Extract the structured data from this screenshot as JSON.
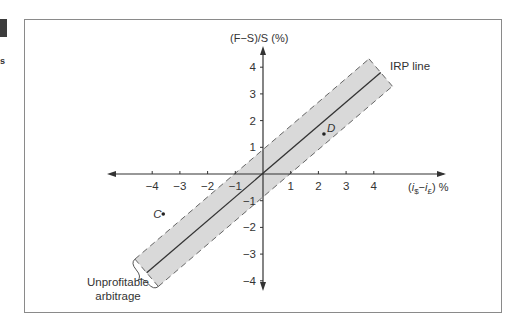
{
  "page": {
    "side_mark": "s"
  },
  "chart_data": {
    "type": "line",
    "title": "",
    "xlabel": "(i$ − i£) %",
    "xlabel_parts": {
      "open": "(",
      "i1": "i",
      "sub1": "$",
      "minus": "−",
      "i2": "i",
      "sub2": "£",
      "close": ")",
      "unit": " %"
    },
    "ylabel": "(F−S)/S (%)",
    "xlim": [
      -5.5,
      6.5
    ],
    "ylim": [
      -4.5,
      4.7
    ],
    "x_ticks": [
      -4,
      -3,
      -2,
      -1,
      1,
      2,
      3,
      4
    ],
    "x_tick_labels": [
      "−4",
      "−3",
      "−2",
      "−1",
      "1",
      "2",
      "3",
      "4"
    ],
    "y_ticks": [
      -4,
      -3,
      -2,
      -1,
      1,
      2,
      3,
      4
    ],
    "y_tick_labels": [
      "−4",
      "−3",
      "−2",
      "−1",
      "1",
      "2",
      "3",
      "4"
    ],
    "grid": false,
    "series": [
      {
        "name": "IRP line",
        "kind": "line",
        "equation": "y = x",
        "x": [
          -4.2,
          4.25
        ],
        "y": [
          -3.7,
          3.8
        ]
      },
      {
        "name": "Unprofitable arbitrage",
        "kind": "band",
        "upper_offset": 1,
        "lower_offset": -1,
        "style": "dashed-boundary, gray fill"
      }
    ],
    "points": [
      {
        "label": "C",
        "x": -3.6,
        "y": -1.5
      },
      {
        "label": "D",
        "x": 2.2,
        "y": 1.5
      }
    ],
    "annotations": [
      {
        "text": "IRP line",
        "target": "IRP line"
      },
      {
        "text_lines": [
          "Unprofitable",
          "arbitrage"
        ],
        "target": "band"
      }
    ],
    "colors": {
      "band_fill": "#d9d9d9",
      "line": "#333333",
      "axis": "#333333",
      "dash": "#666666",
      "frame": "#8a8a8a"
    }
  }
}
